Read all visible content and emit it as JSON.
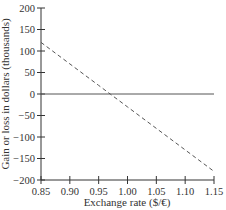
{
  "chart_data": {
    "type": "line",
    "title": "",
    "xlabel": "Exchange rate ($/€)",
    "ylabel": "Gain or loss in dollars (thousands)",
    "xlim": [
      0.85,
      1.15
    ],
    "ylim": [
      -200,
      200
    ],
    "x_ticks": [
      "0.85",
      "0.90",
      "0.95",
      "1.00",
      "1.05",
      "1.10",
      "1.15"
    ],
    "y_ticks": [
      "200",
      "150",
      "100",
      "50",
      "0",
      "-50",
      "-100",
      "-150",
      "-200"
    ],
    "grid": false,
    "legend": null,
    "series": [
      {
        "name": "Gain or loss",
        "style": "dashed",
        "x": [
          0.85,
          0.9,
          0.95,
          0.97,
          1.0,
          1.05,
          1.1,
          1.15
        ],
        "values": [
          120,
          70,
          20,
          0,
          -30,
          -80,
          -130,
          -180
        ]
      },
      {
        "name": "Zero line",
        "style": "solid",
        "x": [
          0.85,
          1.15
        ],
        "values": [
          0,
          0
        ]
      }
    ]
  },
  "colors": {
    "axis": "#333333",
    "line": "#555555"
  }
}
